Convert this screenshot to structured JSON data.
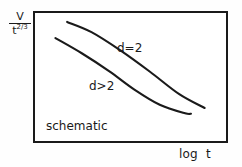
{
  "figure": {
    "kind": "schematic-log-log-plot",
    "caption": "schematic",
    "background_color": "#fefefe",
    "line_color": "#1a1a1a",
    "frame_color": "#1a1a1a"
  },
  "axes": {
    "y_label": {
      "numerator": "V",
      "denominator_base": "t",
      "denominator_exponent": "2/3",
      "full_text": "V / t^(2/3)"
    },
    "x_label": "log  t"
  },
  "annotations": [
    {
      "name": "upper-curve-label",
      "text": "d=2"
    },
    {
      "name": "lower-curve-label",
      "text": "d>2"
    }
  ],
  "chart_data": {
    "type": "line",
    "title": "",
    "subtitle": "schematic",
    "xlabel": "log  t",
    "ylabel": "V / t^(2/3)",
    "grid": false,
    "legend_position": "inline-annotation",
    "axis_ticks": {
      "x": [],
      "y": []
    },
    "xlim": [
      0,
      1
    ],
    "ylim": [
      0,
      1
    ],
    "note": "Schematic decay of V/t^(2/3) versus log t for two dimensionalities; no numeric tick labels are shown, values are normalized frame fractions read off the pixels.",
    "series": [
      {
        "name": "d=2",
        "label": "d=2",
        "style": "solid",
        "points": [
          {
            "x": 0.175,
            "y": 0.917
          },
          {
            "x": 0.3,
            "y": 0.84
          },
          {
            "x": 0.45,
            "y": 0.7
          },
          {
            "x": 0.6,
            "y": 0.54
          },
          {
            "x": 0.75,
            "y": 0.37
          },
          {
            "x": 0.88,
            "y": 0.265
          }
        ]
      },
      {
        "name": "d>2",
        "label": "d>2",
        "style": "solid",
        "points": [
          {
            "x": 0.115,
            "y": 0.795
          },
          {
            "x": 0.25,
            "y": 0.68
          },
          {
            "x": 0.39,
            "y": 0.545
          },
          {
            "x": 0.52,
            "y": 0.405
          },
          {
            "x": 0.65,
            "y": 0.29
          },
          {
            "x": 0.78,
            "y": 0.225
          },
          {
            "x": 0.81,
            "y": 0.222
          }
        ]
      }
    ]
  }
}
